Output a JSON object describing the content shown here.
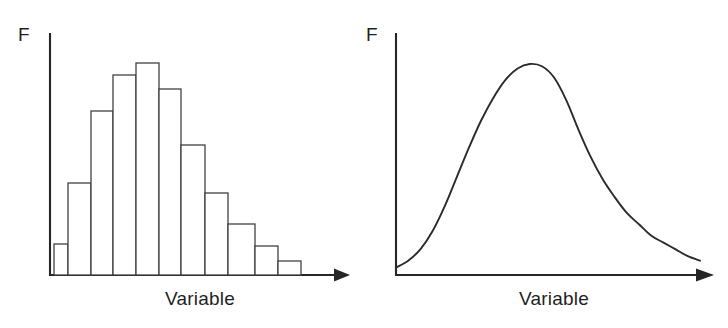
{
  "figure": {
    "background_color": "#ffffff",
    "ink_color": "#262626",
    "panels": [
      {
        "id": "histogram",
        "y_axis_label": "F",
        "x_axis_label": "Variable"
      },
      {
        "id": "frequency-curve",
        "y_axis_label": "F",
        "x_axis_label": "Variable"
      }
    ]
  },
  "chart_data": [
    {
      "type": "bar",
      "id": "histogram",
      "title": "",
      "subtitle": "",
      "xlabel": "Variable",
      "ylabel": "F",
      "categories": [
        "1",
        "2",
        "3",
        "4",
        "5",
        "6",
        "7",
        "8",
        "9",
        "10",
        "11"
      ],
      "values": [
        13,
        38,
        68,
        83,
        88,
        77,
        54,
        34,
        21,
        12,
        6
      ],
      "xlim": [
        0,
        12
      ],
      "ylim": [
        0,
        100
      ],
      "grid": false,
      "legend": null,
      "notes": "Symmetric bell-shaped frequency histogram; outlined bars, no fill."
    },
    {
      "type": "line",
      "id": "frequency-curve",
      "title": "",
      "subtitle": "",
      "xlabel": "Variable",
      "ylabel": "F",
      "x": [
        0,
        4,
        8,
        12,
        16,
        20,
        24,
        28,
        32,
        36,
        40,
        44,
        48,
        52,
        56,
        60,
        64,
        68,
        72,
        76,
        80,
        84,
        88,
        92,
        96,
        100
      ],
      "y": [
        2,
        5,
        10,
        18,
        29,
        42,
        55,
        67,
        77,
        85,
        90,
        92,
        91,
        86,
        76,
        63,
        51,
        41,
        33,
        26,
        21,
        16,
        13,
        10,
        7,
        5
      ],
      "xlim": [
        0,
        100
      ],
      "ylim": [
        0,
        100
      ],
      "grid": false,
      "legend": null,
      "notes": "Smooth positively-skewed (right-skewed) frequency curve peaking near the left-of-centre with a long right tail."
    }
  ]
}
